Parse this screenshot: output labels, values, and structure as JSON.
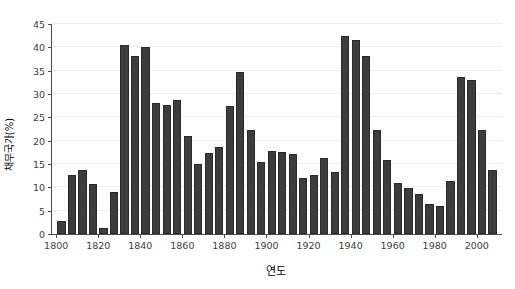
{
  "chart_data": {
    "type": "bar",
    "title": "",
    "xlabel": "연도",
    "ylabel": "채무국가(%)",
    "xlim": [
      1798,
      2012
    ],
    "ylim": [
      0,
      45
    ],
    "grid": true,
    "legend": null,
    "bar_color": "#3c3c3c",
    "y_ticks": [
      0,
      5,
      10,
      15,
      20,
      25,
      30,
      35,
      40,
      45
    ],
    "x_ticks": [
      1800,
      1820,
      1840,
      1860,
      1880,
      1900,
      1920,
      1940,
      1960,
      1980,
      2000
    ],
    "categories": [
      1800,
      1805,
      1810,
      1815,
      1820,
      1825,
      1830,
      1835,
      1840,
      1845,
      1850,
      1855,
      1860,
      1865,
      1870,
      1875,
      1880,
      1885,
      1890,
      1895,
      1900,
      1905,
      1910,
      1915,
      1920,
      1925,
      1930,
      1935,
      1940,
      1945,
      1950,
      1955,
      1960,
      1965,
      1970,
      1975,
      1980,
      1985,
      1990,
      1995,
      2000,
      2005
    ],
    "values": [
      2.8,
      12.6,
      13.7,
      10.8,
      1.2,
      9.1,
      40.4,
      38.2,
      40.1,
      28.0,
      27.6,
      28.7,
      21.0,
      15.1,
      17.4,
      18.6,
      27.5,
      34.8,
      22.3,
      15.4,
      17.8,
      17.5,
      17.2,
      12.0,
      12.6,
      16.2,
      13.2,
      42.4,
      41.6,
      38.1,
      22.3,
      15.9,
      11.0,
      9.8,
      8.5,
      6.5,
      5.9,
      11.3,
      33.7,
      33.1,
      22.3,
      13.7
    ]
  },
  "axes": {
    "y_tick_labels": [
      "0",
      "5",
      "10",
      "15",
      "20",
      "25",
      "30",
      "35",
      "40",
      "45"
    ],
    "x_tick_labels": [
      "1800",
      "1820",
      "1840",
      "1860",
      "1880",
      "1900",
      "1920",
      "1940",
      "1960",
      "1980",
      "2000"
    ]
  }
}
